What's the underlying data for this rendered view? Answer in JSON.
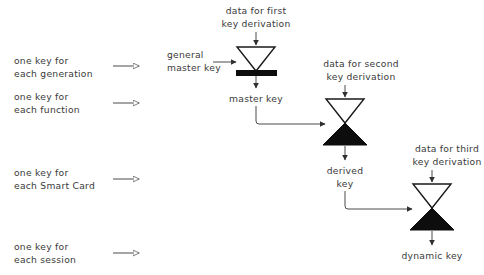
{
  "diagram": {
    "type": "flow-diagram",
    "colors": {
      "background": "#ffffff",
      "text": "#3a3a3a",
      "line": "#4a4a4a",
      "shape_fill_solid": "#0d0d0d",
      "shape_fill_open": "#ffffff",
      "shape_stroke": "#1a1a1a"
    },
    "legend": {
      "items": [
        {
          "id": "generation",
          "line1": "one key for",
          "line2": "each generation",
          "arrow": "open-arrow-icon"
        },
        {
          "id": "function",
          "line1": "one key for",
          "line2": "each function",
          "arrow": "open-arrow-icon"
        },
        {
          "id": "smartcard",
          "line1": "one key for",
          "line2": "each Smart Card",
          "arrow": "open-arrow-icon"
        },
        {
          "id": "session",
          "line1": "one key for",
          "line2": "each session",
          "arrow": "open-arrow-icon"
        }
      ]
    },
    "stages": [
      {
        "id": "stage-1",
        "shape": "funnel-with-bar",
        "input_data_label": {
          "line1": "data for first",
          "line2": "key derivation"
        },
        "side_input_label": {
          "line1": "general",
          "line2": "master key"
        },
        "output_label": {
          "line1": "master key",
          "line2": ""
        }
      },
      {
        "id": "stage-2",
        "shape": "hourglass",
        "input_data_label": {
          "line1": "data for second",
          "line2": "key derivation"
        },
        "side_input_label": {
          "line1": "",
          "line2": ""
        },
        "output_label": {
          "line1": "derived",
          "line2": "key"
        }
      },
      {
        "id": "stage-3",
        "shape": "hourglass",
        "input_data_label": {
          "line1": "data for third",
          "line2": "key derivation"
        },
        "side_input_label": {
          "line1": "",
          "line2": ""
        },
        "output_label": {
          "line1": "dynamic key",
          "line2": ""
        }
      }
    ]
  }
}
